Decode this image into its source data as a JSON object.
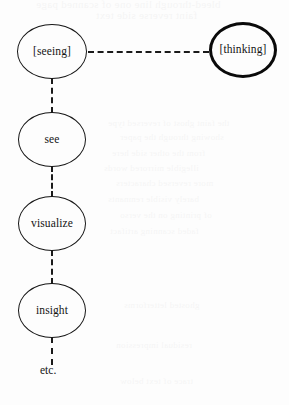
{
  "figure": {
    "background_color": "#fdfdfd",
    "ink_color": "#141414",
    "nodes": [
      {
        "id": "seeing",
        "label": "[seeing]",
        "emphasis": "normal",
        "x": 17,
        "y": 24,
        "w": 70,
        "h": 55
      },
      {
        "id": "thinking",
        "label": "[thinking]",
        "emphasis": "bold",
        "x": 209,
        "y": 22,
        "w": 68,
        "h": 56
      },
      {
        "id": "see",
        "label": "see",
        "emphasis": "normal",
        "x": 18,
        "y": 112,
        "w": 68,
        "h": 55
      },
      {
        "id": "visualize",
        "label": "visualize",
        "emphasis": "normal",
        "x": 18,
        "y": 196,
        "w": 68,
        "h": 55
      },
      {
        "id": "insight",
        "label": "insight",
        "emphasis": "normal",
        "x": 18,
        "y": 283,
        "w": 68,
        "h": 55
      }
    ],
    "terminal": {
      "id": "etc",
      "label": "etc.",
      "x": 40,
      "y": 364
    },
    "connectors": [
      {
        "id": "seeing-to-thinking",
        "orientation": "horizontal",
        "from": "seeing",
        "to": "thinking"
      },
      {
        "id": "seeing-to-see",
        "orientation": "vertical",
        "from": "seeing",
        "to": "see"
      },
      {
        "id": "see-to-visualize",
        "orientation": "vertical",
        "from": "see",
        "to": "visualize"
      },
      {
        "id": "visualize-to-insight",
        "orientation": "vertical",
        "from": "visualize",
        "to": "insight"
      },
      {
        "id": "insight-to-etc",
        "orientation": "vertical",
        "from": "insight",
        "to": "etc"
      }
    ],
    "ghost_text": [
      {
        "text": "bleed-through line one of scanned page",
        "x": 36,
        "y": -2,
        "size": 11
      },
      {
        "text": "faint reverse side text",
        "x": 96,
        "y": 9,
        "size": 11
      },
      {
        "text": "the faint ghost of reversed type",
        "x": 108,
        "y": 118,
        "size": 9
      },
      {
        "text": "showing through the paper",
        "x": 120,
        "y": 132,
        "size": 9
      },
      {
        "text": "from the other side here",
        "x": 112,
        "y": 148,
        "size": 9
      },
      {
        "text": "illegible mirrored words",
        "x": 104,
        "y": 163,
        "size": 9
      },
      {
        "text": "more reversed characters",
        "x": 116,
        "y": 178,
        "size": 9
      },
      {
        "text": "barely visible remnants",
        "x": 108,
        "y": 194,
        "size": 9
      },
      {
        "text": "of printing on the verso",
        "x": 120,
        "y": 210,
        "size": 9
      },
      {
        "text": "faded scanning artifact",
        "x": 110,
        "y": 226,
        "size": 9
      },
      {
        "text": "ghosted letterforms",
        "x": 124,
        "y": 300,
        "size": 9
      },
      {
        "text": "residual impression",
        "x": 116,
        "y": 340,
        "size": 9
      },
      {
        "text": "trace of text below",
        "x": 120,
        "y": 376,
        "size": 9
      }
    ]
  }
}
